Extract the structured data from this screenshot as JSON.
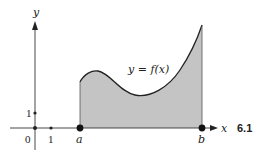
{
  "figure": {
    "number": "6.1",
    "curve_label": "y = f(x)",
    "x_axis_label": "x",
    "y_axis_label": "y",
    "origin_label": "0",
    "x_tick_label": "1",
    "y_tick_label": "1",
    "point_a_label": "a",
    "point_b_label": "b",
    "colors": {
      "fill": "#c4c4c4",
      "stroke": "#222222",
      "axis": "#333333"
    }
  }
}
